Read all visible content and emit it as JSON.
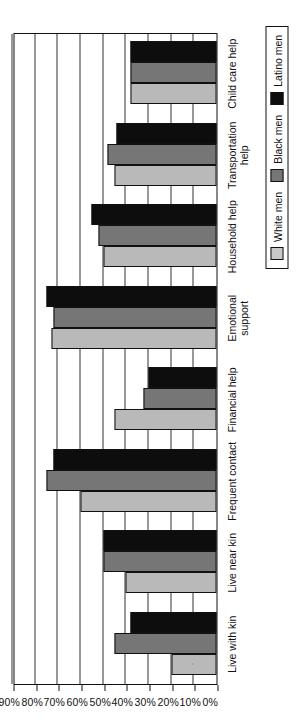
{
  "chart_data": {
    "type": "bar",
    "orientation": "horizontal-rotated",
    "title": "",
    "xlabel": "",
    "ylabel": "",
    "ylim": [
      0,
      90
    ],
    "grid": true,
    "legend_position": "bottom-right",
    "tick_labels": [
      "90%",
      "80%",
      "70%",
      "60%",
      "50%",
      "40%",
      "30%",
      "20%",
      "10%",
      "0%"
    ],
    "tick_values": [
      90,
      80,
      70,
      60,
      50,
      40,
      30,
      20,
      10,
      0
    ],
    "categories": [
      "Live with kin",
      "Live near kin",
      "Frequent contact",
      "Financial help",
      "Emotional\nsupport",
      "Household help",
      "Transportation\nhelp",
      "Child care help"
    ],
    "series": [
      {
        "name": "White men",
        "color": "#b9b9b9",
        "values": [
          20,
          40,
          60,
          45,
          73,
          50,
          45,
          38
        ]
      },
      {
        "name": "Black men",
        "color": "#767676",
        "values": [
          45,
          50,
          75,
          32,
          72,
          52,
          48,
          38
        ]
      },
      {
        "name": "Latino men",
        "color": "#0d0d0d",
        "values": [
          38,
          50,
          72,
          30,
          75,
          55,
          44,
          38
        ]
      }
    ]
  },
  "legend": {
    "items": [
      {
        "label": "White men",
        "swatch": "white-men-swatch"
      },
      {
        "label": "Black men",
        "swatch": "black-men-swatch"
      },
      {
        "label": "Latino men",
        "swatch": "latino-men-swatch"
      }
    ]
  }
}
